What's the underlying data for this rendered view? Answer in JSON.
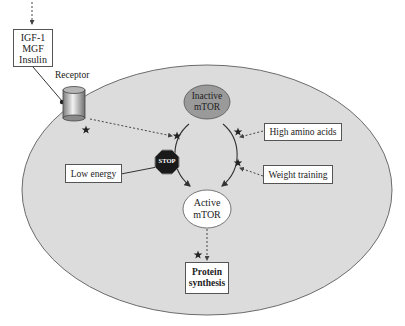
{
  "diagram": {
    "inputs": {
      "growth_factors": [
        "IGF-1",
        "MGF",
        "Insulin"
      ],
      "receptor_label": "Receptor"
    },
    "mtor": {
      "inactive": [
        "Inactive",
        "mTOR"
      ],
      "active": [
        "Active",
        "mTOR"
      ]
    },
    "activators": {
      "amino_acids": "High amino acids",
      "training": "Weight training"
    },
    "inhibitor": {
      "label": "Low energy",
      "stop_sign": "STOP"
    },
    "output": [
      "Protein",
      "synthesis"
    ],
    "icons": [
      "star-icon",
      "stop-sign-icon",
      "receptor-cylinder-icon"
    ],
    "colors": {
      "cell_fill": "#dcdcdc",
      "cell_stroke": "#6b6b6b",
      "inactive_fill": "#9a9a9a",
      "active_fill": "#ffffff",
      "stop_fill": "#1a1a1a"
    }
  }
}
